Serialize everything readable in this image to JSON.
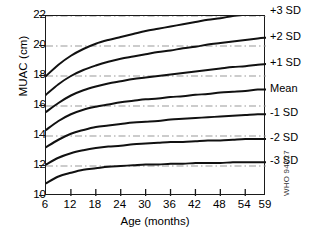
{
  "chart_data": {
    "type": "line",
    "title": "",
    "xlabel": "Age (months)",
    "ylabel": "MUAC (cm)",
    "xlim": [
      6,
      59
    ],
    "ylim": [
      10,
      22
    ],
    "xticks": [
      6,
      12,
      18,
      24,
      30,
      36,
      42,
      48,
      54,
      59
    ],
    "yticks": [
      10,
      12,
      14,
      16,
      18,
      20,
      22
    ],
    "grid": "horizontal dash-dot gridlines at every labelled y tick",
    "legend_position": "right side, inline curve labels",
    "line_color": "#111111",
    "grid_color": "#999999",
    "x": [
      6,
      9,
      12,
      15,
      18,
      21,
      24,
      27,
      30,
      33,
      36,
      39,
      42,
      45,
      48,
      51,
      54,
      57,
      59
    ],
    "series": [
      {
        "name": "+3 SD",
        "label": "+3 SD",
        "values": [
          18.0,
          18.75,
          19.35,
          19.8,
          20.15,
          20.4,
          20.6,
          20.8,
          21.0,
          21.15,
          21.3,
          21.45,
          21.6,
          21.75,
          21.85,
          22.0,
          22.1,
          22.2,
          22.25
        ]
      },
      {
        "name": "+2 SD",
        "label": "+2 SD",
        "values": [
          16.75,
          17.45,
          18.0,
          18.4,
          18.7,
          18.95,
          19.15,
          19.3,
          19.45,
          19.6,
          19.7,
          19.85,
          19.95,
          20.1,
          20.2,
          20.3,
          20.4,
          20.5,
          20.55
        ]
      },
      {
        "name": "+1 SD",
        "label": "+1 SD",
        "values": [
          15.6,
          16.2,
          16.7,
          17.05,
          17.3,
          17.5,
          17.65,
          17.8,
          17.9,
          18.0,
          18.1,
          18.2,
          18.3,
          18.4,
          18.5,
          18.6,
          18.65,
          18.75,
          18.8
        ]
      },
      {
        "name": "Mean",
        "label": "Mean",
        "values": [
          14.4,
          15.0,
          15.45,
          15.75,
          15.95,
          16.1,
          16.25,
          16.35,
          16.45,
          16.5,
          16.6,
          16.65,
          16.75,
          16.8,
          16.9,
          16.95,
          17.0,
          17.1,
          17.1
        ]
      },
      {
        "name": "-1 SD",
        "label": "-1 SD",
        "values": [
          13.25,
          13.75,
          14.15,
          14.4,
          14.6,
          14.7,
          14.8,
          14.9,
          14.95,
          15.0,
          15.1,
          15.15,
          15.2,
          15.25,
          15.3,
          15.35,
          15.4,
          15.45,
          15.45
        ]
      },
      {
        "name": "-2 SD",
        "label": "-2 SD",
        "values": [
          12.1,
          12.55,
          12.85,
          13.05,
          13.2,
          13.3,
          13.35,
          13.45,
          13.5,
          13.55,
          13.6,
          13.6,
          13.65,
          13.7,
          13.7,
          13.75,
          13.8,
          13.8,
          13.8
        ]
      },
      {
        "name": "-3 SD",
        "label": "-3 SD",
        "values": [
          10.85,
          11.3,
          11.55,
          11.75,
          11.85,
          11.95,
          12.0,
          12.05,
          12.1,
          12.1,
          12.15,
          12.15,
          12.2,
          12.2,
          12.2,
          12.25,
          12.25,
          12.25,
          12.25
        ]
      }
    ]
  },
  "axes": {
    "ylabel": "MUAC (cm)",
    "xlabel": "Age (months)",
    "yticks": [
      "22",
      "20",
      "18",
      "16",
      "14",
      "12",
      "10"
    ],
    "xticks": [
      "6",
      "12",
      "18",
      "24",
      "30",
      "36",
      "42",
      "48",
      "54",
      "59"
    ]
  },
  "curve_labels": [
    "+3 SD",
    "+2 SD",
    "+1 SD",
    "Mean",
    "-1 SD",
    "-2 SD",
    "-3 SD"
  ],
  "footer": {
    "code": "WHO 94727"
  }
}
